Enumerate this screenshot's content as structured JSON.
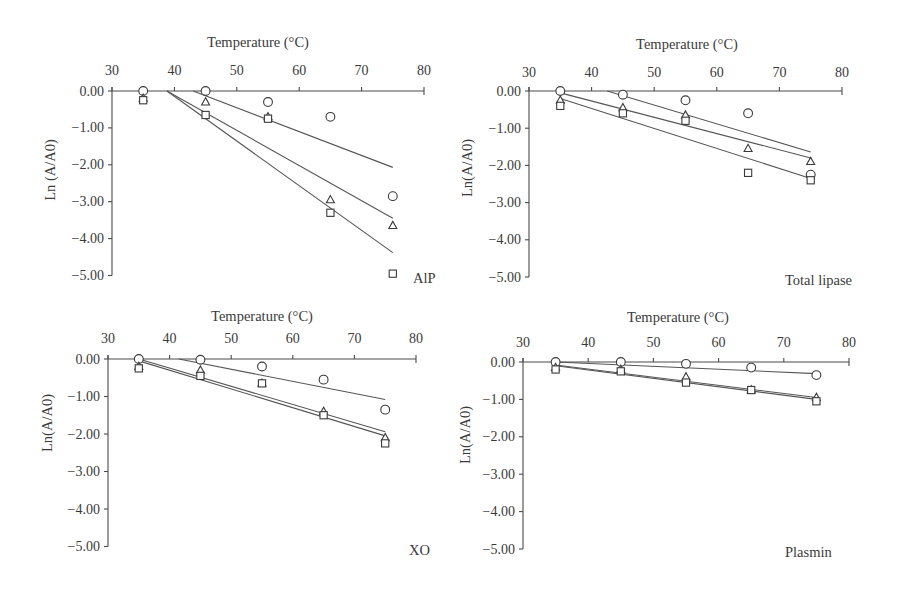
{
  "figure": {
    "panel_count": 4
  },
  "chart_data": [
    {
      "type": "scatter",
      "title": "AlP",
      "xlabel": "Temperature (°C)",
      "ylabel": "Ln (A/A0)",
      "xlim": [
        30,
        80
      ],
      "ylim": [
        -5,
        0
      ],
      "x_axis_position": "top",
      "grid": false,
      "legend": null,
      "xticks": [
        30,
        40,
        50,
        60,
        70,
        80
      ],
      "ytick_values": [
        0,
        -1,
        -2,
        -3,
        -4,
        -5
      ],
      "ytick_labels": [
        "0.00",
        "−1.00",
        "−2.00",
        "−3.00",
        "−4.00",
        "−5.00"
      ],
      "series": [
        {
          "marker": "circle",
          "x": [
            35,
            45,
            55,
            65,
            75
          ],
          "y": [
            0.0,
            0.0,
            -0.3,
            -0.7,
            -2.85
          ]
        },
        {
          "marker": "triangle",
          "x": [
            35,
            45,
            55,
            65,
            75
          ],
          "y": [
            -0.2,
            -0.3,
            -0.7,
            -2.95,
            -3.65
          ]
        },
        {
          "marker": "square",
          "x": [
            35,
            45,
            55,
            65,
            75
          ],
          "y": [
            -0.25,
            -0.65,
            -0.75,
            -3.3,
            -4.95
          ]
        }
      ],
      "fit_lines": [
        {
          "marker": "circle",
          "x": [
            43.0,
            75
          ],
          "y": [
            0.0,
            -2.07
          ]
        },
        {
          "marker": "triangle",
          "x": [
            38.8,
            75
          ],
          "y": [
            0.0,
            -3.45
          ]
        },
        {
          "marker": "square",
          "x": [
            38.8,
            75
          ],
          "y": [
            0.0,
            -4.38
          ]
        }
      ]
    },
    {
      "type": "scatter",
      "title": "Total lipase",
      "xlabel": "Temperature (°C)",
      "ylabel": "Ln(A/A0)",
      "xlim": [
        30,
        80
      ],
      "ylim": [
        -5,
        0
      ],
      "x_axis_position": "top",
      "grid": false,
      "legend": null,
      "xticks": [
        30,
        40,
        50,
        60,
        70,
        80
      ],
      "ytick_values": [
        0,
        -1,
        -2,
        -3,
        -4,
        -5
      ],
      "ytick_labels": [
        "0.00",
        "−1.00",
        "−2.00",
        "−3.00",
        "−4.00",
        "−5.00"
      ],
      "series": [
        {
          "marker": "circle",
          "x": [
            35,
            45,
            55,
            65,
            75
          ],
          "y": [
            0.0,
            -0.1,
            -0.25,
            -0.6,
            -2.25
          ]
        },
        {
          "marker": "triangle",
          "x": [
            35,
            45,
            55,
            65,
            75
          ],
          "y": [
            -0.25,
            -0.45,
            -0.65,
            -1.55,
            -1.9
          ]
        },
        {
          "marker": "square",
          "x": [
            35,
            45,
            55,
            65,
            75
          ],
          "y": [
            -0.4,
            -0.6,
            -0.8,
            -2.2,
            -2.4
          ]
        }
      ],
      "fit_lines": [
        {
          "marker": "circle",
          "x": [
            42.5,
            75
          ],
          "y": [
            0.0,
            -1.64
          ]
        },
        {
          "marker": "triangle",
          "x": [
            35.0,
            75
          ],
          "y": [
            -0.05,
            -1.8
          ]
        },
        {
          "marker": "square",
          "x": [
            35.0,
            75
          ],
          "y": [
            -0.2,
            -2.35
          ]
        }
      ]
    },
    {
      "type": "scatter",
      "title": "XO",
      "xlabel": "Temperature (°C)",
      "ylabel": "Ln(A/A0)",
      "xlim": [
        30,
        80
      ],
      "ylim": [
        -5,
        0
      ],
      "x_axis_position": "top",
      "grid": false,
      "legend": null,
      "xticks": [
        30,
        40,
        50,
        60,
        70,
        80
      ],
      "ytick_values": [
        0,
        -1,
        -2,
        -3,
        -4,
        -5
      ],
      "ytick_labels": [
        "0.00",
        "−1.00",
        "−2.00",
        "−3.00",
        "−4.00",
        "−5.00"
      ],
      "series": [
        {
          "marker": "circle",
          "x": [
            35,
            45,
            55,
            65,
            75
          ],
          "y": [
            0.0,
            -0.02,
            -0.2,
            -0.55,
            -1.35
          ]
        },
        {
          "marker": "triangle",
          "x": [
            35,
            45,
            55,
            65,
            75
          ],
          "y": [
            -0.2,
            -0.3,
            -0.65,
            -1.4,
            -2.1
          ]
        },
        {
          "marker": "square",
          "x": [
            35,
            45,
            55,
            65,
            75
          ],
          "y": [
            -0.25,
            -0.45,
            -0.65,
            -1.5,
            -2.25
          ]
        }
      ],
      "fit_lines": [
        {
          "marker": "circle",
          "x": [
            41.5,
            75
          ],
          "y": [
            0.0,
            -1.08
          ]
        },
        {
          "marker": "triangle",
          "x": [
            35.0,
            75
          ],
          "y": [
            0.0,
            -1.94
          ]
        },
        {
          "marker": "square",
          "x": [
            35.0,
            75
          ],
          "y": [
            -0.05,
            -2.05
          ]
        }
      ]
    },
    {
      "type": "scatter",
      "title": "Plasmin",
      "xlabel": "Temperature (°C)",
      "ylabel": "Ln(A/A0)",
      "xlim": [
        30,
        80
      ],
      "ylim": [
        -5,
        0
      ],
      "x_axis_position": "top",
      "grid": false,
      "legend": null,
      "xticks": [
        30,
        40,
        50,
        60,
        70,
        80
      ],
      "ytick_values": [
        0,
        -1,
        -2,
        -3,
        -4,
        -5
      ],
      "ytick_labels": [
        "0.00",
        "−1.00",
        "−2.00",
        "−3.00",
        "−4.00",
        "−5.00"
      ],
      "series": [
        {
          "marker": "circle",
          "x": [
            35,
            45,
            55,
            65,
            75
          ],
          "y": [
            0.0,
            0.0,
            -0.05,
            -0.15,
            -0.35
          ]
        },
        {
          "marker": "triangle",
          "x": [
            35,
            45,
            55,
            65,
            75
          ],
          "y": [
            -0.15,
            -0.2,
            -0.4,
            -0.75,
            -0.95
          ]
        },
        {
          "marker": "square",
          "x": [
            35,
            45,
            55,
            65,
            75
          ],
          "y": [
            -0.2,
            -0.25,
            -0.55,
            -0.75,
            -1.05
          ]
        }
      ],
      "fit_lines": [
        {
          "marker": "circle",
          "x": [
            35,
            75
          ],
          "y": [
            0.0,
            -0.31
          ]
        },
        {
          "marker": "triangle",
          "x": [
            35,
            75
          ],
          "y": [
            -0.08,
            -0.95
          ]
        },
        {
          "marker": "square",
          "x": [
            35,
            75
          ],
          "y": [
            -0.1,
            -1.0
          ]
        }
      ]
    }
  ]
}
